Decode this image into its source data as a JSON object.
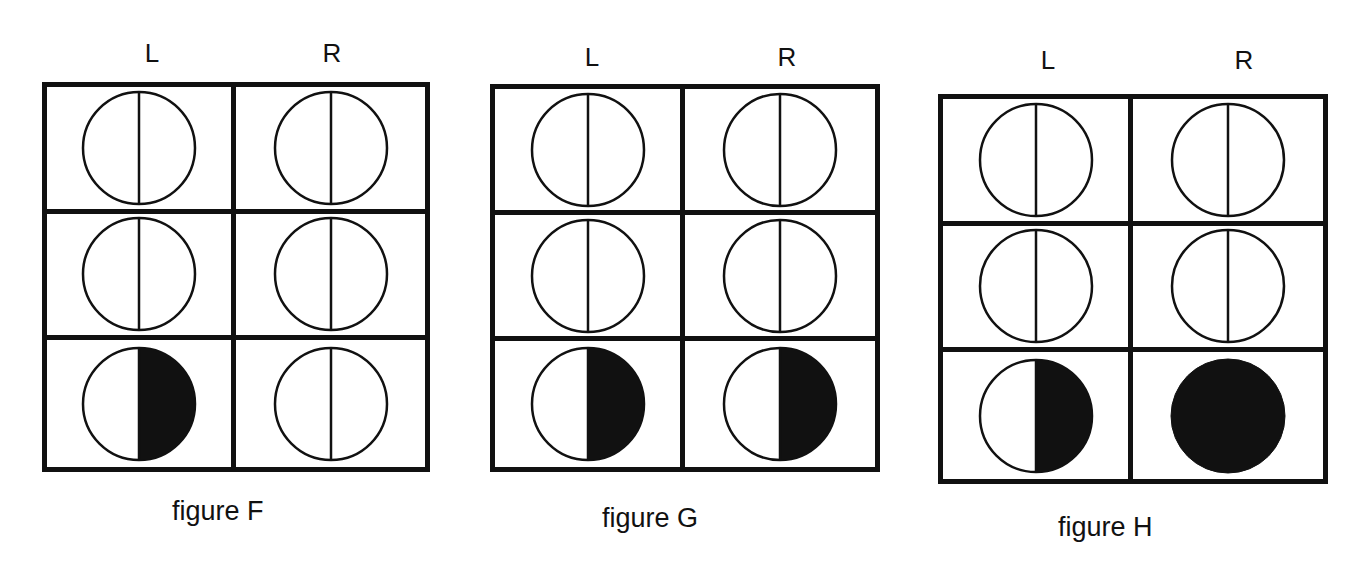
{
  "figures": [
    {
      "id": "F",
      "caption": "figure F",
      "columns": [
        "L",
        "R"
      ],
      "cells": [
        {
          "row": 1,
          "L": "half-line",
          "R": "half-line"
        },
        {
          "row": 2,
          "L": "half-line",
          "R": "half-line"
        },
        {
          "row": 3,
          "L": "right-half-filled",
          "R": "half-line"
        }
      ]
    },
    {
      "id": "G",
      "caption": "figure G",
      "columns": [
        "L",
        "R"
      ],
      "cells": [
        {
          "row": 1,
          "L": "half-line",
          "R": "half-line"
        },
        {
          "row": 2,
          "L": "half-line",
          "R": "half-line"
        },
        {
          "row": 3,
          "L": "right-half-filled",
          "R": "right-half-filled"
        }
      ]
    },
    {
      "id": "H",
      "caption": "figure H",
      "columns": [
        "L",
        "R"
      ],
      "cells": [
        {
          "row": 1,
          "L": "half-line",
          "R": "half-line"
        },
        {
          "row": 2,
          "L": "half-line",
          "R": "half-line"
        },
        {
          "row": 3,
          "L": "right-half-filled",
          "R": "fully-filled"
        }
      ]
    }
  ],
  "colors": {
    "ink": "#111111",
    "paper": "#ffffff"
  }
}
